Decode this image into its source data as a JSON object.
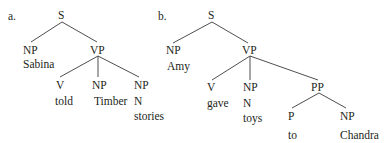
{
  "trees": [
    {
      "id": "a",
      "marker": "a.",
      "root": "S",
      "subject": {
        "cat": "NP",
        "word": "Sabina"
      },
      "vp": {
        "cat": "VP",
        "children": [
          {
            "cat": "V",
            "word": "told"
          },
          {
            "cat": "NP",
            "word": "Timber"
          },
          {
            "cat": "NP",
            "sub": "N",
            "word": "stories"
          }
        ]
      }
    },
    {
      "id": "b",
      "marker": "b.",
      "root": "S",
      "subject": {
        "cat": "NP",
        "word": "Amy"
      },
      "vp": {
        "cat": "VP",
        "children": [
          {
            "cat": "V",
            "word": "gave"
          },
          {
            "cat": "NP",
            "sub": "N",
            "word": "toys"
          },
          {
            "cat": "PP",
            "children": [
              {
                "cat": "P",
                "word": "to"
              },
              {
                "cat": "NP",
                "word": "Chandra"
              }
            ]
          }
        ]
      }
    }
  ]
}
